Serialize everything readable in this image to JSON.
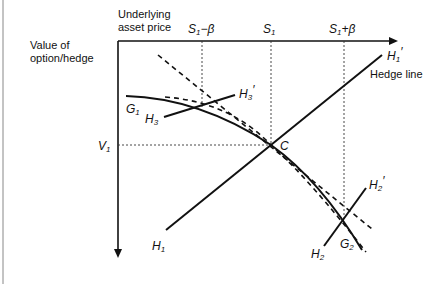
{
  "labels": {
    "x_axis_title_line1": "Underlying",
    "x_axis_title_line2": "asset price",
    "y_axis_title_line1": "Value of",
    "y_axis_title_line2": "option/hedge",
    "s1_minus_beta": "S",
    "s1_minus_beta_sub": "1",
    "s1_minus_beta_suffix": "−β",
    "s1": "S",
    "s1_sub": "1",
    "s1_plus_beta": "S",
    "s1_plus_beta_sub": "1",
    "s1_plus_beta_suffix": "+β",
    "v1": "V",
    "v1_sub": "1",
    "c_point": "C",
    "hedge_line": "Hedge line",
    "g1": "G",
    "g1_sub": "1",
    "g2": "G",
    "g2_sub": "2",
    "h1": "H",
    "h1_sub": "1",
    "h1p": "H",
    "h1p_sub": "1",
    "h1p_prime": "′",
    "h2": "H",
    "h2_sub": "2",
    "h2p": "H",
    "h2p_sub": "2",
    "h2p_prime": "′",
    "h3": "H",
    "h3_sub": "3",
    "h3p": "H",
    "h3p_sub": "3",
    "h3p_prime": "′"
  },
  "colors": {
    "line": "#111111",
    "background": "#ffffff"
  }
}
